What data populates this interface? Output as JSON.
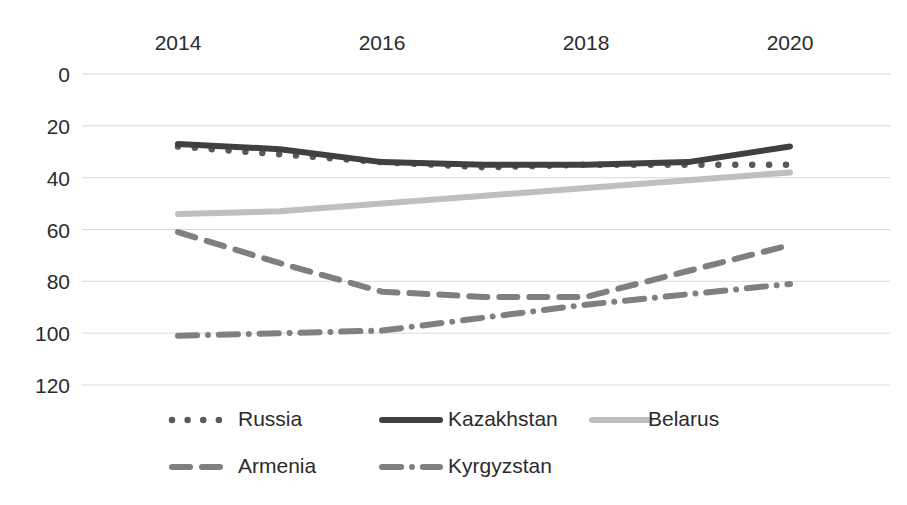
{
  "chart_data": {
    "type": "line",
    "title": "",
    "subtitle": "",
    "xlabel": "",
    "ylabel": "",
    "x": [
      2014,
      2015,
      2016,
      2017,
      2018,
      2019,
      2020
    ],
    "x_tick_labels": [
      "2014",
      "2016",
      "2018",
      "2020"
    ],
    "x_ticks": [
      2014,
      2016,
      2018,
      2020
    ],
    "xlim": [
      2013.6,
      2020.6
    ],
    "y_tick_labels": [
      "0",
      "20",
      "40",
      "60",
      "80",
      "100",
      "120"
    ],
    "y_ticks": [
      0,
      20,
      40,
      60,
      80,
      100,
      120
    ],
    "ylim": [
      0,
      120
    ],
    "y_inverted": true,
    "grid": true,
    "legend_position": "bottom",
    "x_axis_position": "top",
    "series": [
      {
        "name": "Russia",
        "values": [
          28,
          31,
          34,
          36,
          35,
          35,
          35
        ],
        "style": "dotted",
        "color": "#595959",
        "marker": "dot"
      },
      {
        "name": "Kazakhstan",
        "values": [
          27,
          29,
          34,
          35,
          35,
          34,
          28
        ],
        "style": "solid",
        "color": "#404040",
        "marker": "none"
      },
      {
        "name": "Belarus",
        "values": [
          54,
          53,
          50,
          47,
          44,
          41,
          38
        ],
        "style": "solid",
        "color": "#bfbfbf",
        "marker": "none"
      },
      {
        "name": "Armenia",
        "values": [
          61,
          73,
          84,
          86,
          86,
          76,
          66
        ],
        "style": "dashed",
        "color": "#7f7f7f",
        "marker": "none"
      },
      {
        "name": "Kyrgyzstan",
        "values": [
          101,
          100,
          99,
          94,
          89,
          85,
          81
        ],
        "style": "dashdot",
        "color": "#808080",
        "marker": "none"
      }
    ]
  },
  "legend": {
    "entries": [
      {
        "label": "Russia",
        "style": "dotted",
        "color": "#595959"
      },
      {
        "label": "Kazakhstan",
        "style": "solid",
        "color": "#404040"
      },
      {
        "label": "Belarus",
        "style": "solid",
        "color": "#bfbfbf"
      },
      {
        "label": "Armenia",
        "style": "dashed",
        "color": "#7f7f7f"
      },
      {
        "label": "Kyrgyzstan",
        "style": "dashdot",
        "color": "#808080"
      }
    ]
  },
  "colors": {
    "background": "#ffffff",
    "gridline": "#d9d9d9",
    "text": "#2b2b2b"
  }
}
